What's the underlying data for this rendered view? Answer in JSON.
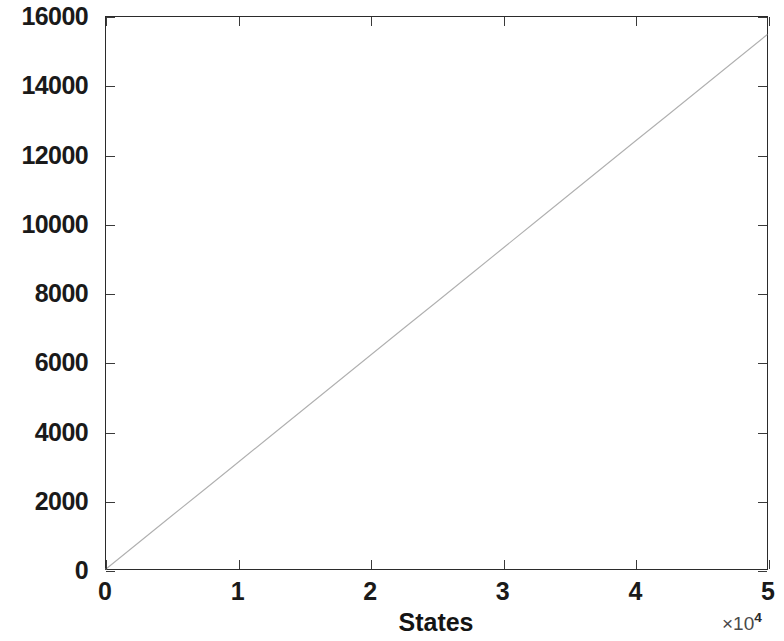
{
  "figure": {
    "background_color": "#ffffff",
    "axes_color": "#2b2b2b",
    "line_color": "#b0b0b0"
  },
  "chart_data": {
    "type": "line",
    "title": "",
    "subtitle": "",
    "xlabel": "States",
    "ylabel": "Accepted candidates",
    "x_exponent_multiplier": "×10",
    "x_exponent_power": "4",
    "xlim": [
      0,
      50000
    ],
    "ylim": [
      0,
      16000
    ],
    "xticks": [
      0,
      10000,
      20000,
      30000,
      40000,
      50000
    ],
    "xtick_labels": [
      "0",
      "1",
      "2",
      "3",
      "4",
      "5"
    ],
    "yticks": [
      0,
      2000,
      4000,
      6000,
      8000,
      10000,
      12000,
      14000,
      16000
    ],
    "ytick_labels": [
      "0",
      "2000",
      "4000",
      "6000",
      "8000",
      "10000",
      "12000",
      "14000",
      "16000"
    ],
    "grid": false,
    "legend": null,
    "legend_position": "none",
    "annotations": [],
    "series": [
      {
        "name": "Accepted candidates",
        "color": "#b0b0b0",
        "line_style": "solid",
        "line_width": 1,
        "marker": "none",
        "x": [
          0,
          2500,
          5000,
          7500,
          10000,
          12500,
          15000,
          17500,
          20000,
          22500,
          25000,
          27500,
          30000,
          32500,
          35000,
          37500,
          40000,
          42500,
          45000,
          47500,
          50000
        ],
        "values": [
          0,
          775,
          1550,
          2320,
          3095,
          3870,
          4645,
          5420,
          6195,
          6970,
          7740,
          8515,
          9290,
          10065,
          10840,
          11615,
          12390,
          13160,
          13935,
          14710,
          15485
        ]
      }
    ]
  }
}
